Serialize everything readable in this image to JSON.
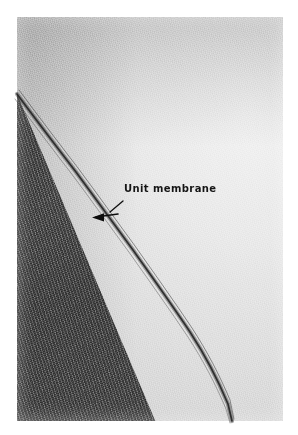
{
  "figure": {
    "kind": "electron-micrograph",
    "print": {
      "border_color": "#ffffff",
      "light_field_color": "#e9e9e9",
      "dark_field_color": "#565656",
      "membrane_line_color": "#2b2b2b"
    }
  },
  "annotations": {
    "label": {
      "text": "Unit membrane",
      "color": "#151515"
    },
    "leader": {
      "name": "leader-line",
      "color": "#101010"
    },
    "arrowhead": {
      "name": "arrowhead",
      "direction": "left",
      "color": "#0d0d0d"
    }
  }
}
